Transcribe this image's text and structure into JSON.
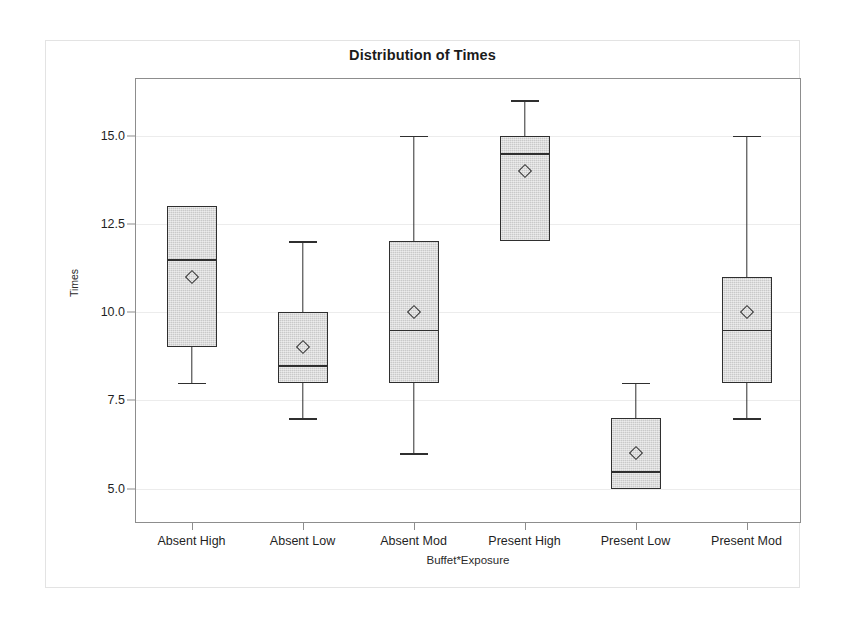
{
  "chart_data": {
    "type": "box",
    "title": "Distribution of Times",
    "xlabel": "Buffet*Exposure",
    "ylabel": "Times",
    "ylim": [
      4.0,
      16.6
    ],
    "grid": true,
    "legend": "none",
    "yticks": [
      "5.0",
      "7.5",
      "10.0",
      "12.5",
      "15.0"
    ],
    "ytick_values": [
      5.0,
      7.5,
      10.0,
      12.5,
      15.0
    ],
    "categories": [
      "Absent High",
      "Absent Low",
      "Absent Mod",
      "Present High",
      "Present Low",
      "Present Mod"
    ],
    "marker_note": "open diamond = mean",
    "boxes": [
      {
        "category": "Absent High",
        "whisker_low": 8.0,
        "q1": 9.0,
        "median": 11.5,
        "q3": 13.0,
        "whisker_high": 13.0,
        "mean": 11.0
      },
      {
        "category": "Absent Low",
        "whisker_low": 7.0,
        "q1": 8.0,
        "median": 8.5,
        "q3": 10.0,
        "whisker_high": 12.0,
        "mean": 9.0
      },
      {
        "category": "Absent Mod",
        "whisker_low": 6.0,
        "q1": 8.0,
        "median": 9.5,
        "q3": 12.0,
        "whisker_high": 15.0,
        "mean": 10.0
      },
      {
        "category": "Present High",
        "whisker_low": 12.0,
        "q1": 12.0,
        "median": 14.5,
        "q3": 15.0,
        "whisker_high": 16.0,
        "mean": 14.0
      },
      {
        "category": "Present Low",
        "whisker_low": 5.0,
        "q1": 5.0,
        "median": 5.5,
        "q3": 7.0,
        "whisker_high": 8.0,
        "mean": 6.0
      },
      {
        "category": "Present Mod",
        "whisker_low": 7.0,
        "q1": 8.0,
        "median": 9.5,
        "q3": 11.0,
        "whisker_high": 15.0,
        "mean": 10.0
      }
    ]
  },
  "colors": {
    "box_fill": "#c9c9c9",
    "box_outline": "#2f2f2f",
    "gridline": "#ececec",
    "axis": "#8d8d8d",
    "text": "#1f1f1f",
    "figure_border": "#e3e3e3",
    "background": "#ffffff"
  }
}
